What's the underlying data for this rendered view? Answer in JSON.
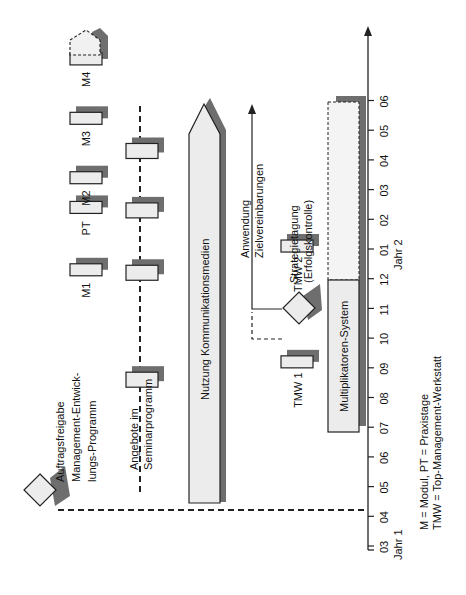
{
  "axis": {
    "ticks": [
      "03",
      "04",
      "05",
      "06",
      "07",
      "08",
      "09",
      "10",
      "11",
      "12",
      "01",
      "02",
      "03",
      "04",
      "05",
      "06"
    ],
    "year_labels": [
      {
        "label": "Jahr 1",
        "at_tick": 0
      },
      {
        "label": "Jahr 2",
        "at_tick": 10
      }
    ]
  },
  "milestones": {
    "auftragsfreigabe": [
      "Auftragsfreigabe",
      "Management-Entwick-",
      "lungs-Programm"
    ],
    "strategietagung": [
      "Strategietagung",
      "(Erfolgskontrolle)"
    ]
  },
  "modules": [
    {
      "label": "M1",
      "at_tick": 9.3
    },
    {
      "label": "PT",
      "at_tick": 11.4
    },
    {
      "label": "M2",
      "at_tick": 12.4
    },
    {
      "label": "M3",
      "at_tick": 14.4
    },
    {
      "label": "M4",
      "at_tick": 16.4
    }
  ],
  "seminar": {
    "label": [
      "Angebote im",
      "Seminarprogramm"
    ],
    "sessions_at_tick": [
      5.6,
      9.2,
      11.3,
      13.3
    ]
  },
  "nutzung": {
    "label": "Nutzung Kommunikationsmedien"
  },
  "tmw": [
    {
      "label": "TMW 1",
      "at_tick": 6.2
    },
    {
      "label": "TMW 2",
      "at_tick": 10.1
    }
  ],
  "anwendung": [
    "Anwendung",
    "Zielvereinbarungen"
  ],
  "multiplikatoren": {
    "label": "Multiplikatoren-System",
    "solid_until_tick": 12,
    "dashed_until_tick": 15.8
  },
  "legend": [
    "M      = Modul, PT = Praxistage",
    "TMW  = Top-Management-Werkstatt"
  ]
}
